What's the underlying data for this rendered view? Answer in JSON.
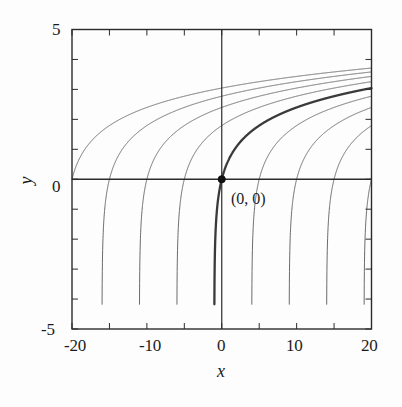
{
  "chart_data": {
    "type": "line",
    "title": "",
    "xlabel": "x",
    "ylabel": "y",
    "xlim": [
      -20,
      20
    ],
    "ylim": [
      -5,
      5
    ],
    "xticks": [
      -20,
      -10,
      0,
      10,
      20
    ],
    "xtick_labels": [
      "-20",
      "-10",
      "0",
      "10",
      "20"
    ],
    "yticks": [
      -5,
      0,
      5
    ],
    "ytick_labels": [
      "-5",
      "0",
      "5"
    ],
    "grid": false,
    "legend": null,
    "annotations": [
      {
        "text": "(0, 0)",
        "x": 0,
        "y": 0,
        "marker": "filled-circle",
        "marker_color": "#111111"
      }
    ],
    "series": [
      {
        "name": "y = ln(x + 21)",
        "shift": -20,
        "highlight": false,
        "color": "#5a5a5a",
        "zero_crossing_x": -20,
        "asymptote_x": -21,
        "value_at_x20": 3.71
      },
      {
        "name": "y = ln(x + 16)",
        "shift": -15,
        "highlight": false,
        "color": "#5a5a5a",
        "zero_crossing_x": -15,
        "asymptote_x": -16,
        "value_at_x20": 3.58
      },
      {
        "name": "y = ln(x + 11)",
        "shift": -10,
        "highlight": false,
        "color": "#5a5a5a",
        "zero_crossing_x": -10,
        "asymptote_x": -11,
        "value_at_x20": 3.43
      },
      {
        "name": "y = ln(x + 6)",
        "shift": -5,
        "highlight": false,
        "color": "#5a5a5a",
        "zero_crossing_x": -5,
        "asymptote_x": -6,
        "value_at_x20": 3.26
      },
      {
        "name": "y = ln(x + 1)",
        "shift": 0,
        "highlight": true,
        "color": "#3a3a3a",
        "zero_crossing_x": 0,
        "asymptote_x": -1,
        "value_at_x20": 3.04
      },
      {
        "name": "y = ln(x - 4)",
        "shift": 5,
        "highlight": false,
        "color": "#5a5a5a",
        "zero_crossing_x": 5,
        "asymptote_x": 4,
        "value_at_x20": 2.77
      },
      {
        "name": "y = ln(x - 9)",
        "shift": 10,
        "highlight": false,
        "color": "#5a5a5a",
        "zero_crossing_x": 10,
        "asymptote_x": 9,
        "value_at_x20": 2.4
      },
      {
        "name": "y = ln(x - 14)",
        "shift": 15,
        "highlight": false,
        "color": "#5a5a5a",
        "zero_crossing_x": 15,
        "asymptote_x": 14,
        "value_at_x20": 1.79
      },
      {
        "name": "y = ln(x - 19)",
        "shift": 20,
        "highlight": false,
        "color": "#5a5a5a",
        "zero_crossing_x": 20,
        "asymptote_x": 19,
        "value_at_x20": 0.0
      }
    ]
  },
  "axes": {
    "x_title": "x",
    "y_title": "y",
    "x_tick_0": "-20",
    "x_tick_1": "-10",
    "x_tick_2": "0",
    "x_tick_3": "10",
    "x_tick_4": "20",
    "y_tick_top": "5",
    "y_tick_mid": "0",
    "y_tick_bottom": "-5"
  },
  "annotation": {
    "origin_label": "(0, 0)"
  },
  "colors": {
    "frame": "#2b2b2b",
    "curve": "#5a5a5a",
    "curve_highlight": "#3a3a3a",
    "text": "#1b1b1b",
    "background": "#fdfdfd",
    "marker": "#111111"
  }
}
